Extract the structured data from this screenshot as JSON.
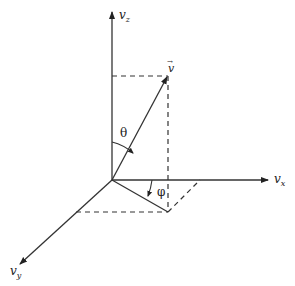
{
  "diagram": {
    "axes": {
      "z": {
        "label": "v",
        "sub": "z"
      },
      "x": {
        "label": "v",
        "sub": "x"
      },
      "y": {
        "label": "v",
        "sub": "y"
      }
    },
    "vector": {
      "label": "v",
      "accent": "→"
    },
    "angles": {
      "theta": "θ",
      "phi": "φ"
    },
    "colors": {
      "line": "#333333",
      "background": "#ffffff"
    }
  }
}
